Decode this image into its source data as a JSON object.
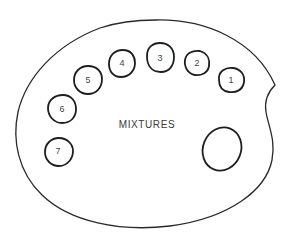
{
  "diagram": {
    "center_label": "MIXTURES",
    "wells": [
      {
        "label": "1",
        "cx": 231,
        "cy": 80,
        "rx": 13,
        "ry": 13
      },
      {
        "label": "2",
        "cx": 197,
        "cy": 63,
        "rx": 12.5,
        "ry": 12.5
      },
      {
        "label": "3",
        "cx": 160,
        "cy": 58,
        "rx": 13.5,
        "ry": 14.5
      },
      {
        "label": "4",
        "cx": 122,
        "cy": 63,
        "rx": 13,
        "ry": 13.5
      },
      {
        "label": "5",
        "cx": 88,
        "cy": 80,
        "rx": 14,
        "ry": 13.5
      },
      {
        "label": "6",
        "cx": 62,
        "cy": 109,
        "rx": 14,
        "ry": 14
      },
      {
        "label": "7",
        "cx": 59,
        "cy": 152,
        "rx": 14,
        "ry": 14
      }
    ],
    "mixing_well": {
      "cx": 222,
      "cy": 149,
      "rx": 19,
      "ry": 22,
      "rotate": 20
    },
    "colors": {
      "stroke": "#222222",
      "text": "#444444",
      "background": "#ffffff"
    }
  }
}
